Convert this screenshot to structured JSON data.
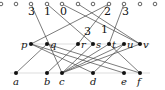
{
  "diagram": {
    "top_nodes": [
      {
        "x": 1,
        "y": 4
      },
      {
        "x": 16,
        "y": 4
      },
      {
        "x": 31,
        "y": 4
      },
      {
        "x": 47,
        "y": 4
      },
      {
        "x": 62,
        "y": 4
      },
      {
        "x": 78,
        "y": 4
      },
      {
        "x": 93,
        "y": 4
      },
      {
        "x": 109,
        "y": 4
      },
      {
        "x": 124,
        "y": 4
      },
      {
        "x": 140,
        "y": 4
      },
      {
        "x": 155,
        "y": 4
      }
    ],
    "top_numbers": [
      {
        "text": "3",
        "x": 28,
        "y": 15
      },
      {
        "text": "1",
        "x": 44,
        "y": 15
      },
      {
        "text": "0",
        "x": 60,
        "y": 15
      },
      {
        "text": "2",
        "x": 104,
        "y": 15
      },
      {
        "text": "3",
        "x": 122,
        "y": 15
      },
      {
        "text": "3",
        "x": 84,
        "y": 35
      },
      {
        "text": "1",
        "x": 101,
        "y": 33
      }
    ],
    "middle_nodes": [
      {
        "label": "p",
        "x": 31,
        "y": 44,
        "lx": 21
      },
      {
        "label": "q",
        "x": 47,
        "y": 44,
        "lx": 50
      },
      {
        "label": "r",
        "x": 78,
        "y": 44,
        "lx": 81
      },
      {
        "label": "s",
        "x": 93,
        "y": 44,
        "lx": 96
      },
      {
        "label": "t",
        "x": 109,
        "y": 44,
        "lx": 112
      },
      {
        "label": "u",
        "x": 124,
        "y": 44,
        "lx": 127
      },
      {
        "label": "v",
        "x": 140,
        "y": 44,
        "lx": 143
      }
    ],
    "bottom_nodes": [
      {
        "label": "a",
        "x": 16,
        "y": 73
      },
      {
        "label": "b",
        "x": 47,
        "y": 73
      },
      {
        "label": "c",
        "x": 62,
        "y": 73
      },
      {
        "label": "d",
        "x": 93,
        "y": 73
      },
      {
        "label": "e",
        "x": 124,
        "y": 73
      },
      {
        "label": "f",
        "x": 140,
        "y": 73
      }
    ],
    "edges": [
      [
        31,
        4,
        62,
        73
      ],
      [
        47,
        4,
        93,
        44
      ],
      [
        62,
        4,
        140,
        44
      ],
      [
        109,
        4,
        31,
        44
      ],
      [
        109,
        4,
        78,
        44
      ],
      [
        124,
        4,
        109,
        44
      ],
      [
        78,
        4,
        140,
        44
      ],
      [
        47,
        44,
        16,
        73
      ],
      [
        31,
        44,
        93,
        73
      ],
      [
        31,
        44,
        124,
        73
      ],
      [
        78,
        44,
        47,
        73
      ],
      [
        93,
        44,
        62,
        73
      ],
      [
        109,
        44,
        62,
        73
      ],
      [
        124,
        44,
        62,
        73
      ],
      [
        109,
        44,
        140,
        73
      ],
      [
        124,
        44,
        93,
        73
      ],
      [
        47,
        44,
        140,
        73
      ],
      [
        140,
        44,
        62,
        73
      ]
    ],
    "colors": {
      "line": "#444444",
      "node": "#111111",
      "guide": "#cccccc"
    }
  }
}
